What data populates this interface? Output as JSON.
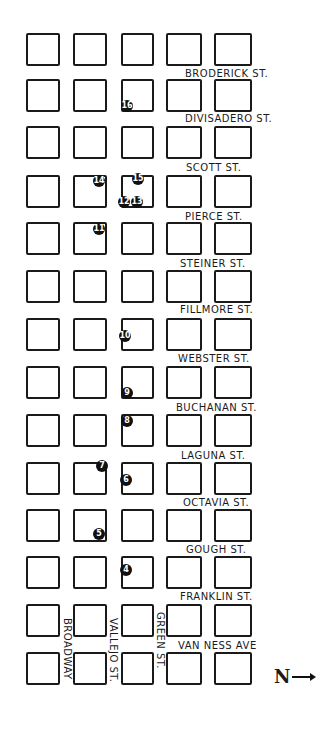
{
  "map": {
    "columns_x": [
      26,
      73,
      121,
      166,
      214
    ],
    "column_widths": [
      34,
      34,
      33,
      36,
      38
    ],
    "rows_y": [
      33,
      79,
      126,
      175,
      222,
      270,
      318,
      366,
      414,
      462,
      509,
      556,
      604,
      652
    ],
    "row_height": 33,
    "horizontal_streets": [
      {
        "label": "Broderick St.",
        "x": 185,
        "y": 68
      },
      {
        "label": "Divisadero St.",
        "x": 185,
        "y": 113
      },
      {
        "label": "Scott St.",
        "x": 186,
        "y": 162
      },
      {
        "label": "Pierce St.",
        "x": 185,
        "y": 211
      },
      {
        "label": "Steiner St.",
        "x": 180,
        "y": 258
      },
      {
        "label": "Fillmore St.",
        "x": 180,
        "y": 304
      },
      {
        "label": "Webster St.",
        "x": 178,
        "y": 353
      },
      {
        "label": "Buchanan St.",
        "x": 176,
        "y": 402
      },
      {
        "label": "Laguna St.",
        "x": 181,
        "y": 450
      },
      {
        "label": "Octavia St.",
        "x": 183,
        "y": 497
      },
      {
        "label": "Gough St.",
        "x": 186,
        "y": 544
      },
      {
        "label": "Franklin St.",
        "x": 180,
        "y": 591
      },
      {
        "label": "Van Ness Ave",
        "x": 178,
        "y": 640
      }
    ],
    "vertical_streets": [
      {
        "label": "Broadway",
        "x": 62,
        "y": 618
      },
      {
        "label": "Vallejo St.",
        "x": 108,
        "y": 618
      },
      {
        "label": "Green St.",
        "x": 155,
        "y": 612
      }
    ],
    "markers": [
      {
        "n": "4",
        "x": 126,
        "y": 570
      },
      {
        "n": "5",
        "x": 99,
        "y": 534
      },
      {
        "n": "6",
        "x": 126,
        "y": 480
      },
      {
        "n": "7",
        "x": 102,
        "y": 466
      },
      {
        "n": "8",
        "x": 127,
        "y": 421
      },
      {
        "n": "9",
        "x": 127,
        "y": 393
      },
      {
        "n": "10",
        "x": 125,
        "y": 336
      },
      {
        "n": "11",
        "x": 99,
        "y": 229
      },
      {
        "n": "12",
        "x": 124,
        "y": 202
      },
      {
        "n": "13",
        "x": 137,
        "y": 202
      },
      {
        "n": "14",
        "x": 99,
        "y": 181
      },
      {
        "n": "15",
        "x": 138,
        "y": 179
      },
      {
        "n": "16",
        "x": 127,
        "y": 106
      }
    ],
    "north_indicator": {
      "glyph": "N",
      "icon": "arrow-right"
    }
  }
}
